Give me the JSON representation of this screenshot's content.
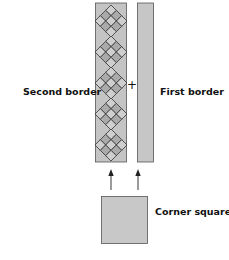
{
  "diagram": {
    "labels": {
      "second_border": "Second border",
      "first_border": "First border",
      "corner_square": "Corner square",
      "plus": "+"
    },
    "colors": {
      "strip_fill": "#c4c4c4",
      "strip_stroke": "#444444",
      "diamond_light": "#cfcfcf",
      "diamond_dark": "#a9a9a9",
      "square_fill": "#c8c8c8",
      "arrow": "#222222"
    },
    "second_border_motifs": 5
  }
}
